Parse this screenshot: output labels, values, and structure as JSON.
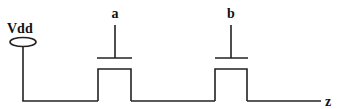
{
  "diagram": {
    "type": "transistor-series-circuit",
    "supply": {
      "label": "Vdd"
    },
    "transistors": [
      {
        "id": "a",
        "gate_label": "a"
      },
      {
        "id": "b",
        "gate_label": "b"
      }
    ],
    "output": {
      "label": "z"
    }
  }
}
